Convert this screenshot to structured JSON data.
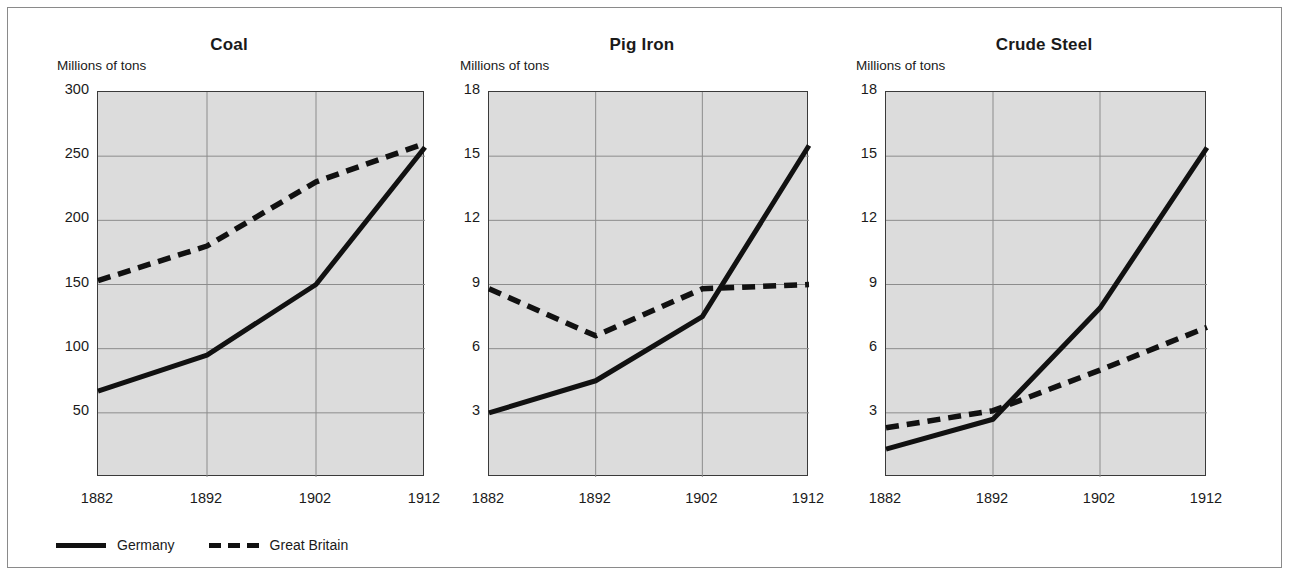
{
  "figure": {
    "background_color": "#ffffff",
    "border_color": "#8a8a8a",
    "plot_background_color": "#dcdcdc",
    "grid_color": "#8c8c8c",
    "line_color": "#111111"
  },
  "legend": {
    "entries": [
      {
        "label": "Germany",
        "style": "solid"
      },
      {
        "label": "Great Britain",
        "style": "dashed"
      }
    ]
  },
  "chart_data": [
    {
      "type": "line",
      "title": "Coal",
      "ylabel": "Millions of tons",
      "xlabel": "",
      "x": [
        1882,
        1892,
        1902,
        1912
      ],
      "xticklabels": [
        "1882",
        "1892",
        "1902",
        "1912"
      ],
      "yticks": [
        50,
        100,
        150,
        200,
        250,
        300
      ],
      "yticklabels": [
        "50",
        "100",
        "150",
        "200",
        "250",
        "300"
      ],
      "ylim": [
        0,
        300
      ],
      "xlim": [
        1882,
        1912
      ],
      "grid": true,
      "legend_position": "below-figure",
      "series": [
        {
          "name": "Germany",
          "style": "solid",
          "values": [
            67,
            95,
            150,
            257
          ]
        },
        {
          "name": "Great Britain",
          "style": "dashed",
          "values": [
            153,
            180,
            230,
            260
          ]
        }
      ]
    },
    {
      "type": "line",
      "title": "Pig Iron",
      "ylabel": "Millions of tons",
      "xlabel": "",
      "x": [
        1882,
        1892,
        1902,
        1912
      ],
      "xticklabels": [
        "1882",
        "1892",
        "1902",
        "1912"
      ],
      "yticks": [
        3,
        6,
        9,
        12,
        15,
        18
      ],
      "yticklabels": [
        "3",
        "6",
        "9",
        "12",
        "15",
        "18"
      ],
      "ylim": [
        0,
        18
      ],
      "xlim": [
        1882,
        1912
      ],
      "grid": true,
      "legend_position": "below-figure",
      "series": [
        {
          "name": "Germany",
          "style": "solid",
          "values": [
            3.0,
            4.5,
            7.5,
            15.5
          ]
        },
        {
          "name": "Great Britain",
          "style": "dashed",
          "values": [
            8.8,
            6.6,
            8.8,
            9.0
          ]
        }
      ]
    },
    {
      "type": "line",
      "title": "Crude Steel",
      "ylabel": "Millions of tons",
      "xlabel": "",
      "x": [
        1882,
        1892,
        1902,
        1912
      ],
      "xticklabels": [
        "1882",
        "1892",
        "1902",
        "1912"
      ],
      "yticks": [
        3,
        6,
        9,
        12,
        15,
        18
      ],
      "yticklabels": [
        "3",
        "6",
        "9",
        "12",
        "15",
        "18"
      ],
      "ylim": [
        0,
        18
      ],
      "xlim": [
        1882,
        1912
      ],
      "grid": true,
      "legend_position": "below-figure",
      "series": [
        {
          "name": "Germany",
          "style": "solid",
          "values": [
            1.3,
            2.7,
            7.9,
            15.4
          ]
        },
        {
          "name": "Great Britain",
          "style": "dashed",
          "values": [
            2.3,
            3.1,
            5.0,
            7.0
          ]
        }
      ]
    }
  ]
}
